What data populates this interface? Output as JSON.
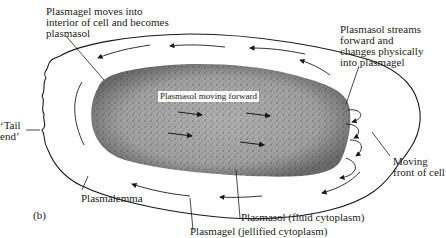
{
  "diagram": {
    "panel_label": "(b)",
    "labels": {
      "plasmagel_moves": "Plasmagel moves into\ninterior of cell and becomes\nplasmasol",
      "plasmasol_streams": "Plasmasol streams\nforward and\nchanges physically\ninto plasmagel",
      "tail_end": "‘Tail\nend’",
      "plasmasol_moving_forward": "Plasmasol moving forward",
      "moving_front": "Moving\nfront of cell",
      "plasmalemma": "Plasmalemma",
      "plasmasol_fluid": "Plasmasol (fluid cytoplasm)",
      "plasmagel_jellified": "Plasmagel (jellified cytoplasm)"
    },
    "colors": {
      "plasmasol_fill": "#a8a8a8",
      "stipple": "#3a3a3a",
      "line": "#1a1a1a"
    }
  }
}
